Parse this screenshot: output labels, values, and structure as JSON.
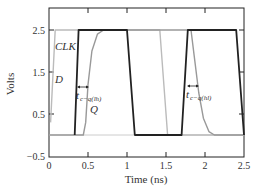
{
  "chart_data": {
    "type": "line",
    "title": "",
    "xlabel": "Time (ns)",
    "ylabel": "Volts",
    "xlim": [
      0,
      2.5
    ],
    "ylim": [
      -0.5,
      3.0
    ],
    "xticks": [
      0,
      0.5,
      1,
      1.5,
      2,
      2.5
    ],
    "xtick_labels": [
      "0",
      "0.5",
      "1",
      "1.5",
      "2",
      "2.5"
    ],
    "yticks": [
      -0.5,
      0.5,
      1.5,
      2.5
    ],
    "ytick_labels": [
      "−0.5",
      "0.5",
      "1.5",
      "2.5"
    ],
    "grid": false,
    "legend": null,
    "series": [
      {
        "name": "CLK",
        "color": "#222222",
        "width": 1.8,
        "x": [
          0.33,
          0.38,
          1.0,
          1.1,
          1.7,
          1.78,
          2.4,
          2.5
        ],
        "y": [
          0,
          2.5,
          2.5,
          0,
          0,
          2.5,
          2.5,
          0
        ]
      },
      {
        "name": "D",
        "color": "#bbbbbb",
        "width": 1.4,
        "x": [
          0.02,
          0.08,
          1.42,
          1.52,
          2.5
        ],
        "y": [
          0.3,
          2.5,
          2.5,
          0,
          0
        ]
      },
      {
        "name": "Q",
        "color": "#999999",
        "width": 1.4,
        "x": [
          0,
          0.44,
          0.47,
          0.5,
          0.55,
          0.62,
          0.7,
          1.82,
          1.86,
          1.92,
          1.98,
          2.05,
          2.12,
          2.5
        ],
        "y": [
          0,
          0,
          0.3,
          1.2,
          2.0,
          2.4,
          2.5,
          2.5,
          1.9,
          1.0,
          0.4,
          0.08,
          0,
          0
        ]
      }
    ],
    "annotations": [
      {
        "text": "CLK",
        "x": 0.1,
        "y": 2.1
      },
      {
        "text": "D",
        "x": 0.1,
        "y": 1.3
      },
      {
        "text": "Q",
        "x": 0.52,
        "y": 0.6
      },
      {
        "text": "t",
        "sub": "c−q(lh)",
        "x": 0.36,
        "y": 0.85,
        "arrow_from": 0.36,
        "arrow_to": 0.5,
        "arrow_y": 1.15
      },
      {
        "text": "t",
        "sub": "c−q(hl)",
        "x": 1.77,
        "y": 0.95,
        "arrow_from": 1.77,
        "arrow_to": 1.92,
        "arrow_y": 1.2
      }
    ]
  },
  "labels": {
    "xlabel": "Time (ns)",
    "ylabel": "Volts",
    "clk": "CLK",
    "d": "D",
    "q": "Q",
    "tcq_lh_main": "t",
    "tcq_lh_sub": "c−q(lh)",
    "tcq_hl_main": "t",
    "tcq_hl_sub": "c−q(hl)",
    "xt0": "0",
    "xt1": "0.5",
    "xt2": "1",
    "xt3": "1.5",
    "xt4": "2",
    "xt5": "2.5",
    "yt0": "−0.5",
    "yt1": "0.5",
    "yt2": "1.5",
    "yt3": "2.5"
  }
}
